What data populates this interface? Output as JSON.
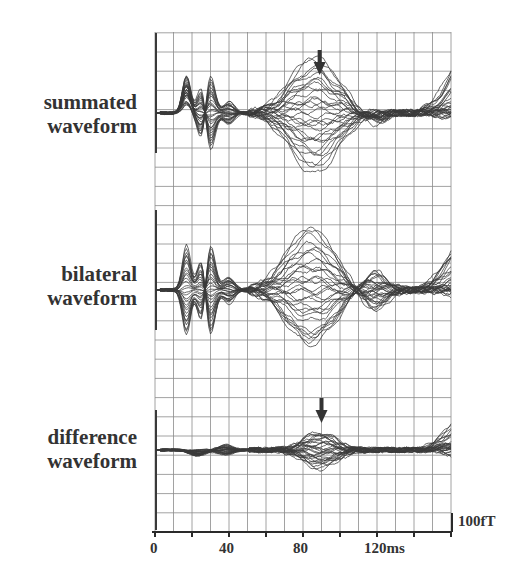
{
  "chart_data": {
    "type": "line",
    "title": "",
    "xlabel": "ms",
    "ylabel": "",
    "x_range_ms": [
      0,
      160
    ],
    "x_ticks": [
      0,
      40,
      80,
      120
    ],
    "x_tick_labels": [
      "0",
      "40",
      "80",
      "120ms"
    ],
    "minor_tick_step_ms": 20,
    "grid": true,
    "grid_step_ms": 10,
    "scale_bar": "100fT",
    "panels": [
      {
        "label_line1": "summated",
        "label_line2": "waveform",
        "traces_count": 30,
        "arrow_at_ms": 89,
        "components": [
          {
            "name": "onset-artifact",
            "latency_ms": 1,
            "sign": "up"
          },
          {
            "name": "peak-15ms",
            "latency_ms": 17,
            "sign": "up"
          },
          {
            "name": "peak-25ms",
            "latency_ms": 27,
            "sign": "bipolar"
          },
          {
            "name": "peak-85ms",
            "latency_ms": 88,
            "sign": "bipolar",
            "marked": true
          },
          {
            "name": "late-rise",
            "latency_ms": 155,
            "sign": "up"
          }
        ]
      },
      {
        "label_line1": "bilateral",
        "label_line2": "waveform",
        "traces_count": 30,
        "components": [
          {
            "name": "onset-artifact",
            "latency_ms": 1,
            "sign": "up"
          },
          {
            "name": "peak-15ms",
            "latency_ms": 17,
            "sign": "bipolar"
          },
          {
            "name": "peak-25ms",
            "latency_ms": 27,
            "sign": "bipolar"
          },
          {
            "name": "peak-85ms",
            "latency_ms": 85,
            "sign": "bipolar"
          },
          {
            "name": "late-rise",
            "latency_ms": 155,
            "sign": "up"
          }
        ]
      },
      {
        "label_line1": "difference",
        "label_line2": "waveform",
        "traces_count": 30,
        "arrow_at_ms": 90,
        "components": [
          {
            "name": "small-dip",
            "latency_ms": 45,
            "sign": "bipolar"
          },
          {
            "name": "peak-90ms",
            "latency_ms": 90,
            "sign": "bipolar",
            "marked": true
          },
          {
            "name": "late-rise",
            "latency_ms": 155,
            "sign": "up"
          }
        ]
      }
    ]
  },
  "colors": {
    "trace": "#3a3a3a",
    "grid": "#8a8a8a",
    "axis": "#2a2a2a",
    "arrow": "#333333"
  }
}
